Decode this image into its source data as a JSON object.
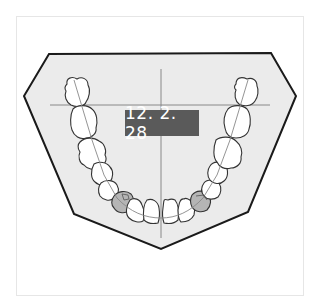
{
  "diagram": {
    "type": "dental-arch-chart",
    "date_label": "12. 2. 28",
    "colors": {
      "background": "#ffffff",
      "frame_border": "#e6e6e6",
      "plate_fill": "#ebebeb",
      "plate_stroke": "#1a1a1a",
      "tooth_fill": "#ffffff",
      "tooth_stroke": "#333333",
      "marked_tooth_fill": "#b5b5b5",
      "crosshair": "#888888",
      "label_bg": "#5a5a5a",
      "label_text": "#ffffff"
    },
    "marked_teeth": [
      "left-first-premolar",
      "right-first-premolar"
    ]
  }
}
